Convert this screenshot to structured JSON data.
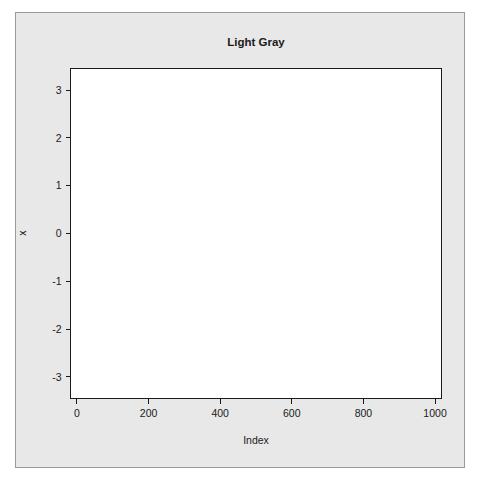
{
  "figure": {
    "device_background": "#ffffff",
    "panel_background": "#e8e8e8",
    "panel_border_color": "#9a9a9a",
    "plot_background": "#ffffff",
    "plot_border_color": "#1a1a1a",
    "point_color": "#2b2b2b",
    "point_symbol": "open-circle",
    "width": 480,
    "height": 482
  },
  "chart_data": {
    "type": "scatter",
    "title": "Light Gray",
    "xlabel": "Index",
    "ylabel": "x",
    "xlim": [
      -18,
      1018
    ],
    "ylim": [
      -3.45,
      3.45
    ],
    "xticks": [
      0,
      200,
      400,
      600,
      800,
      1000
    ],
    "xtick_labels": [
      "0",
      "200",
      "400",
      "600",
      "800",
      "1000"
    ],
    "yticks": [
      -3,
      -2,
      -1,
      0,
      1,
      2,
      3
    ],
    "ytick_labels": [
      "-3",
      "-2",
      "-1",
      "0",
      "1",
      "2",
      "3"
    ],
    "grid": false,
    "legend": null,
    "n_points": 1000,
    "marker": "open-circle",
    "marker_size": 2.2,
    "series": [
      {
        "name": "x",
        "description": "1000 standard normal random deviates plotted against their index",
        "distribution": "normal",
        "mean": 0,
        "sd": 1,
        "x_start": 1,
        "x_step": 1,
        "seed": 20240613,
        "summary": {
          "min": -3.25,
          "q1": -0.68,
          "median": -0.01,
          "q3": 0.67,
          "max": 3.24
        }
      }
    ]
  }
}
